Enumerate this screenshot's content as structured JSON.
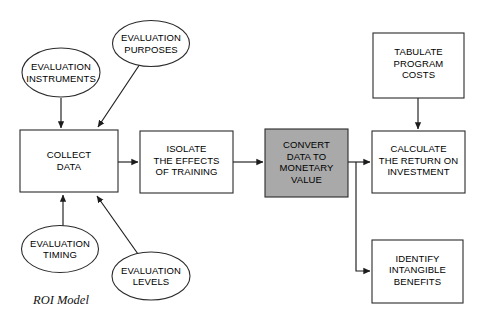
{
  "figure": {
    "caption": "ROI Model",
    "colors": {
      "shaded_node_fill": "#a9a9a9",
      "node_fill": "#ffffff",
      "stroke": "#2b2b2b",
      "background": "#ffffff"
    }
  },
  "nodes": {
    "evaluation_instruments": {
      "shape": "ellipse",
      "lines": [
        "EVALUATION",
        "INSTRUMENTS"
      ],
      "line1": "EVALUATION",
      "line2": "INSTRUMENTS"
    },
    "evaluation_purposes": {
      "shape": "ellipse",
      "lines": [
        "EVALUATION",
        "PURPOSES"
      ],
      "line1": "EVALUATION",
      "line2": "PURPOSES"
    },
    "evaluation_timing": {
      "shape": "ellipse",
      "lines": [
        "EVALUATION",
        "TIMING"
      ],
      "line1": "EVALUATION",
      "line2": "TIMING"
    },
    "evaluation_levels": {
      "shape": "ellipse",
      "lines": [
        "EVALUATION",
        "LEVELS"
      ],
      "line1": "EVALUATION",
      "line2": "LEVELS"
    },
    "collect_data": {
      "shape": "rect",
      "lines": [
        "COLLECT",
        "DATA"
      ],
      "line1": "COLLECT",
      "line2": "DATA"
    },
    "isolate_effects": {
      "shape": "rect",
      "lines": [
        "ISOLATE",
        "THE EFFECTS",
        "OF TRAINING"
      ],
      "line1": "ISOLATE",
      "line2": "THE EFFECTS",
      "line3": "OF TRAINING"
    },
    "convert_data": {
      "shape": "rect",
      "shaded": true,
      "lines": [
        "CONVERT",
        "DATA TO",
        "MONETARY",
        "VALUE"
      ],
      "line1": "CONVERT",
      "line2": "DATA TO",
      "line3": "MONETARY",
      "line4": "VALUE"
    },
    "tabulate_costs": {
      "shape": "rect",
      "lines": [
        "TABULATE",
        "PROGRAM",
        "COSTS"
      ],
      "line1": "TABULATE",
      "line2": "PROGRAM",
      "line3": "COSTS"
    },
    "calculate_roi": {
      "shape": "rect",
      "lines": [
        "CALCULATE",
        "THE RETURN ON",
        "INVESTMENT"
      ],
      "line1": "CALCULATE",
      "line2": "THE RETURN ON",
      "line3": "INVESTMENT"
    },
    "identify_intangible": {
      "shape": "rect",
      "lines": [
        "IDENTIFY",
        "INTANGIBLE",
        "BENEFITS"
      ],
      "line1": "IDENTIFY",
      "line2": "INTANGIBLE",
      "line3": "BENEFITS"
    }
  },
  "edges": [
    {
      "from": "evaluation_instruments",
      "to": "collect_data",
      "style": "straight-vertical"
    },
    {
      "from": "evaluation_purposes",
      "to": "collect_data",
      "style": "diagonal"
    },
    {
      "from": "evaluation_timing",
      "to": "collect_data",
      "style": "straight-vertical"
    },
    {
      "from": "evaluation_levels",
      "to": "collect_data",
      "style": "diagonal"
    },
    {
      "from": "collect_data",
      "to": "isolate_effects",
      "style": "straight-horizontal"
    },
    {
      "from": "isolate_effects",
      "to": "convert_data",
      "style": "straight-horizontal"
    },
    {
      "from": "convert_data",
      "to": "calculate_roi",
      "style": "straight-horizontal"
    },
    {
      "from": "convert_data",
      "to": "identify_intangible",
      "style": "elbow"
    },
    {
      "from": "tabulate_costs",
      "to": "calculate_roi",
      "style": "straight-vertical"
    }
  ]
}
